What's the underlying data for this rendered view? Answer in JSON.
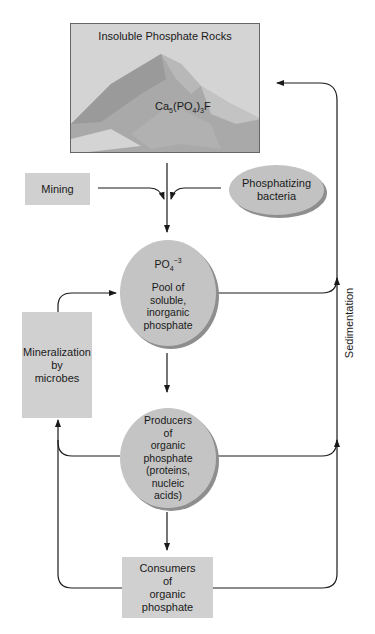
{
  "diagram": {
    "rock_box": {
      "title": "Insoluble Phosphate Rocks",
      "formula": {
        "ca": "Ca",
        "ca_sub": "5",
        "po": "(PO",
        "po_sub": "4",
        "close": ")",
        "close_sub": "3",
        "f": "F"
      }
    },
    "mining": {
      "label": "Mining"
    },
    "bacteria": {
      "line1": "Phosphatizing",
      "line2": "bacteria"
    },
    "pool": {
      "ion": {
        "base": "PO",
        "sub": "4",
        "sup": "−3"
      },
      "lines": [
        "Pool of",
        "soluble,",
        "inorganic",
        "phosphate"
      ]
    },
    "mineralization": {
      "lines": [
        "Mineralization",
        "by",
        "microbes"
      ]
    },
    "producers": {
      "lines": [
        "Producers",
        "of",
        "organic",
        "phosphate",
        "(proteins,",
        "nucleic",
        "acids)"
      ]
    },
    "consumers": {
      "lines": [
        "Consumers",
        "of",
        "organic",
        "phosphate"
      ]
    },
    "sedimentation": {
      "label": "Sedimentation"
    },
    "colors": {
      "box_fill": "#d0d0d0",
      "circle_fill": "#c4c4c4",
      "shadow": "#8e8e8e",
      "line": "#1a1a1a"
    }
  }
}
